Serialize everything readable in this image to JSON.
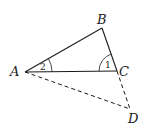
{
  "diagram": {
    "points": {
      "A": {
        "label": "A",
        "x": 25,
        "y": 72
      },
      "B": {
        "label": "B",
        "x": 102,
        "y": 28
      },
      "C": {
        "label": "C",
        "x": 117,
        "y": 71
      },
      "D": {
        "label": "D",
        "x": 130,
        "y": 109
      }
    },
    "solid_segments": [
      "AB",
      "BC",
      "AC"
    ],
    "dashed_segments": [
      "AD",
      "CD"
    ],
    "angles": [
      {
        "label": "1",
        "vertex": "C"
      },
      {
        "label": "2",
        "vertex": "A"
      }
    ]
  }
}
